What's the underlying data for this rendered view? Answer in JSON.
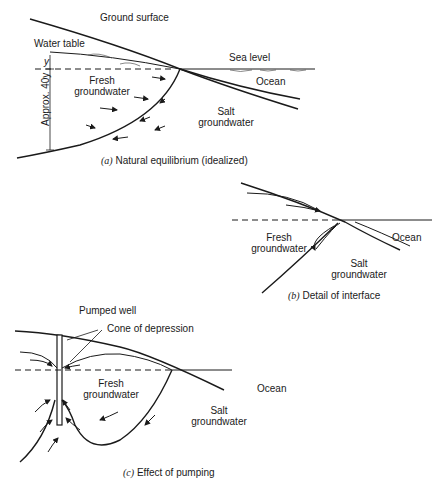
{
  "panel_a": {
    "ground_surface": "Ground surface",
    "water_table": "Water table",
    "sea_level": "Sea level",
    "y_label": "y",
    "depth_label": "Approx. 40y",
    "fresh_line1": "Fresh",
    "fresh_line2": "groundwater",
    "ocean": "Ocean",
    "salt_line1": "Salt",
    "salt_line2": "groundwater",
    "caption_letter": "(a)",
    "caption_text": "Natural equilibrium (idealized)"
  },
  "panel_b": {
    "fresh_line1": "Fresh",
    "fresh_line2": "groundwater",
    "ocean": "Ocean",
    "salt_line1": "Salt",
    "salt_line2": "groundwater",
    "caption_letter": "(b)",
    "caption_text": "Detail of interface"
  },
  "panel_c": {
    "pumped_well": "Pumped well",
    "cone_of_depression": "Cone of depression",
    "fresh_line1": "Fresh",
    "fresh_line2": "groundwater",
    "ocean": "Ocean",
    "salt_line1": "Salt",
    "salt_line2": "groundwater",
    "caption_letter": "(c)",
    "caption_text": "Effect of pumping"
  },
  "colors": {
    "line": "#1a1a1a",
    "water_hatch": "#555555",
    "background": "#ffffff"
  }
}
